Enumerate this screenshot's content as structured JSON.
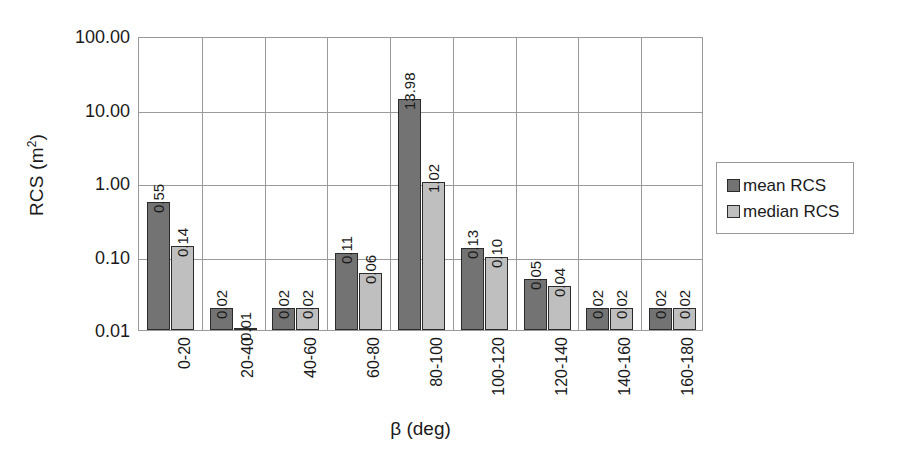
{
  "chart_data": {
    "type": "bar",
    "title": "",
    "xlabel": "β (deg)",
    "ylabel": "RCS (m²)",
    "ylabel_base": "RCS (m",
    "ylabel_sup": "2",
    "ylabel_tail": ")",
    "yscale": "log",
    "ylim": [
      0.01,
      100.0
    ],
    "ytick_labels": [
      "100.00",
      "10.00",
      "1.00",
      "0.10",
      "0.01"
    ],
    "ytick_values": [
      100.0,
      10.0,
      1.0,
      0.1,
      0.01
    ],
    "grid": true,
    "grid_axis": "both",
    "legend_position": "right-outside",
    "categories": [
      "0-20",
      "20-40",
      "40-60",
      "60-80",
      "80-100",
      "100-120",
      "120-140",
      "140-160",
      "160-180"
    ],
    "series": [
      {
        "name": "mean RCS",
        "color": "#737373",
        "values": [
          0.55,
          0.02,
          0.02,
          0.11,
          13.98,
          0.13,
          0.05,
          0.02,
          0.02
        ],
        "labels": [
          "0.55",
          "0.02",
          "0.02",
          "0.11",
          "13.98",
          "0.13",
          "0.05",
          "0.02",
          "0.02"
        ]
      },
      {
        "name": "median RCS",
        "color": "#bfbfbf",
        "values": [
          0.14,
          0.01,
          0.02,
          0.06,
          1.02,
          0.1,
          0.04,
          0.02,
          0.02
        ],
        "labels": [
          "0.14",
          "0.01",
          "0.02",
          "0.06",
          "1.02",
          "0.10",
          "0.04",
          "0.02",
          "0.02"
        ]
      }
    ]
  },
  "legend": {
    "items": [
      {
        "label": "mean RCS",
        "color": "#737373"
      },
      {
        "label": "median RCS",
        "color": "#bfbfbf"
      }
    ]
  }
}
